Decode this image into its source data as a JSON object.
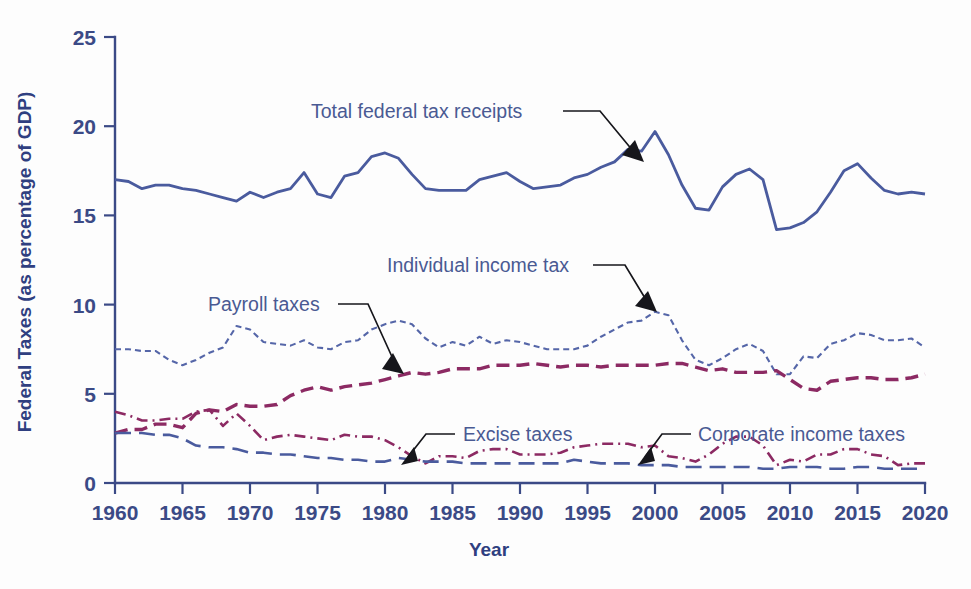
{
  "chart_data": {
    "type": "line",
    "title": "",
    "xlabel": "Year",
    "ylabel": "Federal Taxes (as percentage of GDP)",
    "xlim": [
      1960,
      2020
    ],
    "ylim": [
      0,
      25
    ],
    "xticks": [
      1960,
      1965,
      1970,
      1975,
      1980,
      1985,
      1990,
      1995,
      2000,
      2005,
      2010,
      2015,
      2020
    ],
    "yticks": [
      0,
      5,
      10,
      15,
      20,
      25
    ],
    "grid": false,
    "legend_position": "inline-annotations",
    "x": [
      1960,
      1961,
      1962,
      1963,
      1964,
      1965,
      1966,
      1967,
      1968,
      1969,
      1970,
      1971,
      1972,
      1973,
      1974,
      1975,
      1976,
      1977,
      1978,
      1979,
      1980,
      1981,
      1982,
      1983,
      1984,
      1985,
      1986,
      1987,
      1988,
      1989,
      1990,
      1991,
      1992,
      1993,
      1994,
      1995,
      1996,
      1997,
      1998,
      1999,
      2000,
      2001,
      2002,
      2003,
      2004,
      2005,
      2006,
      2007,
      2008,
      2009,
      2010,
      2011,
      2012,
      2013,
      2014,
      2015,
      2016,
      2017,
      2018,
      2019,
      2020
    ],
    "series": [
      {
        "name": "Total federal tax receipts",
        "color": "#4a5b9e",
        "style": "solid",
        "width": 2.8,
        "values": [
          17.0,
          16.9,
          16.5,
          16.7,
          16.7,
          16.5,
          16.4,
          16.2,
          16.0,
          15.8,
          16.3,
          16.0,
          16.3,
          16.5,
          17.4,
          16.2,
          16.0,
          17.2,
          17.4,
          18.3,
          18.5,
          18.2,
          17.3,
          16.5,
          16.4,
          16.4,
          16.4,
          17.0,
          17.2,
          17.4,
          16.9,
          16.5,
          16.6,
          16.7,
          17.1,
          17.3,
          17.7,
          18.0,
          18.7,
          18.6,
          19.7,
          18.4,
          16.7,
          15.4,
          15.3,
          16.6,
          17.3,
          17.6,
          17.0,
          14.2,
          14.3,
          14.6,
          15.2,
          16.3,
          17.5,
          17.9,
          17.1,
          16.4,
          16.2,
          16.3,
          16.2
        ]
      },
      {
        "name": "Individual income tax",
        "color": "#5566a8",
        "style": "dotted-fine",
        "width": 2.1,
        "values": [
          7.5,
          7.5,
          7.4,
          7.4,
          6.9,
          6.6,
          6.9,
          7.3,
          7.6,
          8.8,
          8.6,
          7.9,
          7.8,
          7.7,
          8.0,
          7.6,
          7.5,
          7.9,
          8.0,
          8.6,
          8.9,
          9.1,
          8.9,
          8.1,
          7.6,
          7.9,
          7.7,
          8.2,
          7.8,
          8.0,
          7.9,
          7.7,
          7.5,
          7.5,
          7.5,
          7.7,
          8.2,
          8.6,
          9.0,
          9.1,
          9.6,
          9.4,
          8.0,
          6.9,
          6.6,
          7.0,
          7.5,
          7.8,
          7.4,
          6.1,
          6.1,
          7.1,
          7.0,
          7.8,
          8.0,
          8.4,
          8.3,
          8.0,
          8.0,
          8.1,
          7.6
        ]
      },
      {
        "name": "Payroll taxes",
        "color": "#8c2a63",
        "style": "dashed-heavy",
        "width": 3.4,
        "values": [
          2.8,
          3.0,
          3.0,
          3.3,
          3.3,
          3.1,
          3.9,
          4.1,
          4.0,
          4.4,
          4.3,
          4.3,
          4.4,
          4.9,
          5.2,
          5.4,
          5.2,
          5.4,
          5.5,
          5.6,
          5.8,
          6.0,
          6.2,
          6.1,
          6.2,
          6.4,
          6.4,
          6.4,
          6.6,
          6.6,
          6.6,
          6.7,
          6.6,
          6.5,
          6.6,
          6.6,
          6.5,
          6.6,
          6.6,
          6.6,
          6.6,
          6.7,
          6.7,
          6.5,
          6.3,
          6.4,
          6.2,
          6.2,
          6.2,
          6.3,
          5.8,
          5.3,
          5.2,
          5.7,
          5.8,
          5.9,
          5.9,
          5.8,
          5.8,
          5.9,
          6.1
        ]
      },
      {
        "name": "Corporate income taxes",
        "color": "#8c2a63",
        "style": "dash-dot",
        "width": 2.6,
        "values": [
          4.0,
          3.8,
          3.5,
          3.5,
          3.6,
          3.6,
          4.0,
          4.1,
          3.2,
          3.9,
          3.2,
          2.4,
          2.6,
          2.7,
          2.6,
          2.5,
          2.4,
          2.7,
          2.6,
          2.6,
          2.4,
          2.0,
          1.5,
          1.1,
          1.5,
          1.5,
          1.4,
          1.8,
          1.9,
          1.9,
          1.6,
          1.6,
          1.6,
          1.7,
          2.0,
          2.1,
          2.2,
          2.2,
          2.2,
          2.0,
          2.1,
          1.5,
          1.4,
          1.2,
          1.6,
          2.2,
          2.6,
          2.6,
          2.1,
          1.0,
          1.3,
          1.2,
          1.6,
          1.6,
          1.9,
          1.9,
          1.6,
          1.5,
          1.0,
          1.1,
          1.1
        ]
      },
      {
        "name": "Excise taxes",
        "color": "#4a5b9e",
        "style": "dashed-long",
        "width": 2.6,
        "values": [
          2.8,
          2.8,
          2.8,
          2.7,
          2.7,
          2.5,
          2.1,
          2.0,
          2.0,
          1.9,
          1.7,
          1.7,
          1.6,
          1.6,
          1.5,
          1.4,
          1.4,
          1.3,
          1.3,
          1.2,
          1.2,
          1.4,
          1.3,
          1.2,
          1.2,
          1.2,
          1.1,
          1.1,
          1.1,
          1.1,
          1.1,
          1.1,
          1.1,
          1.1,
          1.3,
          1.2,
          1.1,
          1.1,
          1.1,
          1.0,
          1.0,
          1.0,
          0.9,
          0.9,
          0.9,
          0.9,
          0.9,
          0.9,
          0.8,
          0.8,
          0.9,
          0.9,
          0.9,
          0.8,
          0.8,
          0.9,
          0.9,
          0.8,
          0.8,
          0.8,
          0.8
        ]
      }
    ],
    "annotations": [
      {
        "label": "Total federal tax receipts",
        "text_x": 311,
        "text_y": 118,
        "anchor": "start",
        "leader": "M 563 111 L 600 111 L 638 157",
        "head": "635,140 644,162 622,155"
      },
      {
        "label": "Individual income tax",
        "text_x": 387,
        "text_y": 272,
        "anchor": "start",
        "leader": "M 593 265 L 625 265 L 651 308",
        "head": "648,291 657,312 635,306"
      },
      {
        "label": "Payroll taxes",
        "text_x": 208,
        "text_y": 311,
        "anchor": "start",
        "leader": "M 338 304 L 368 304 L 398 370",
        "head": "393,353 404,374 382,369"
      },
      {
        "label": "Excise taxes",
        "text_x": 463,
        "text_y": 441,
        "anchor": "start",
        "leader": "M 455 434 L 426 434 L 408 457",
        "head": "401,465 414,447 418,461"
      },
      {
        "label": "Corporate income taxes",
        "text_x": 698,
        "text_y": 441,
        "anchor": "start",
        "leader": "M 691 434 L 662 434 L 645 457",
        "head": "638,465 651,447 655,461"
      }
    ],
    "colors": {
      "axis": "#3b4a86",
      "tick_label": "#3b4a86",
      "axis_title": "#2f3f80",
      "annotation_text": "#4a5a93",
      "blue_series": "#4a5b9e",
      "magenta_series": "#8c2a63",
      "background": "#fdfdfd"
    }
  }
}
